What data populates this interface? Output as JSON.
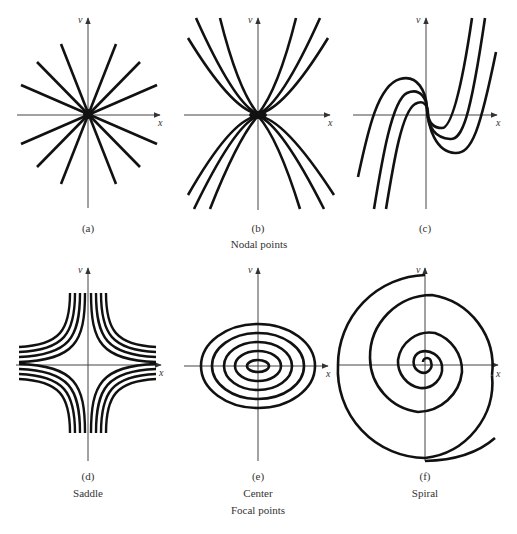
{
  "figure": {
    "group_top_label": "Nodal points",
    "group_bottom_label": "Focal points",
    "stroke_color": "#111111",
    "axis_color": "#333333",
    "panels": [
      {
        "id": "a",
        "label": "(a)",
        "subtitle": "",
        "type": "star node",
        "x_axis": "x",
        "y_axis": "v"
      },
      {
        "id": "b",
        "label": "(b)",
        "subtitle": "",
        "type": "improper node (parabolic)",
        "x_axis": "x",
        "y_axis": "v"
      },
      {
        "id": "c",
        "label": "(c)",
        "subtitle": "",
        "type": "degenerate node (cubic)",
        "x_axis": "x",
        "y_axis": "v"
      },
      {
        "id": "d",
        "label": "(d)",
        "subtitle": "Saddle",
        "type": "saddle",
        "x_axis": "x",
        "y_axis": "v"
      },
      {
        "id": "e",
        "label": "(e)",
        "subtitle": "Center",
        "type": "center",
        "x_axis": "x",
        "y_axis": "v"
      },
      {
        "id": "f",
        "label": "(f)",
        "subtitle": "Spiral",
        "type": "spiral",
        "x_axis": "x",
        "y_axis": "v"
      }
    ]
  }
}
